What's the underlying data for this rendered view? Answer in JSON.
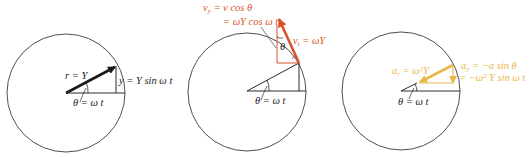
{
  "colors": {
    "line": "#2a2a2a",
    "circle": "#3a3a3a",
    "velocity": "#d9532a",
    "acceleration": "#e8b84a"
  },
  "panels": [
    {
      "id": "position",
      "radius_label": "r = Y",
      "displacement_label": "y = Y sin ω t",
      "angle_label": "θ = ω t"
    },
    {
      "id": "velocity",
      "component_label_line1": "v",
      "component_label_line1_sub": "y",
      "component_label_line1_rest": " = v cos θ",
      "component_label_line2": "= ωY cos ω t",
      "tangential_label": "v",
      "tangential_label_sub": "t",
      "tangential_label_rest": " = ωY",
      "inner_angle_label": "θ",
      "angle_label": "θ = ω t"
    },
    {
      "id": "acceleration",
      "radial_label": "a",
      "radial_label_sub": "r",
      "radial_label_rest": " = ω²Y",
      "component_label_line1": "a",
      "component_label_line1_sub": "y",
      "component_label_line1_rest": " = −a sin θ",
      "component_label_line2": "= −ω² Y sin ω t",
      "angle_label": "θ = ω t"
    }
  ]
}
